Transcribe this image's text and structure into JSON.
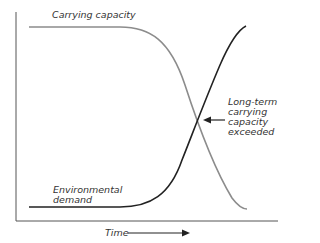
{
  "diagram": {
    "curves": [
      {
        "name": "Carrying capacity",
        "color": "#8c8c8c",
        "trend": "high flat then declining"
      },
      {
        "name": "Environmental demand",
        "color": "#222222",
        "trend": "low flat then rising"
      }
    ],
    "labels": {
      "carrying_capacity": "Carrying capacity",
      "environmental_demand_line1": "Environmental",
      "environmental_demand_line2": "demand",
      "exceeded_line1": "Long-term",
      "exceeded_line2": "carrying",
      "exceeded_line3": "capacity",
      "exceeded_line4": "exceeded",
      "x_axis": "Time"
    },
    "annotation": {
      "points_to": "intersection of curves"
    }
  }
}
